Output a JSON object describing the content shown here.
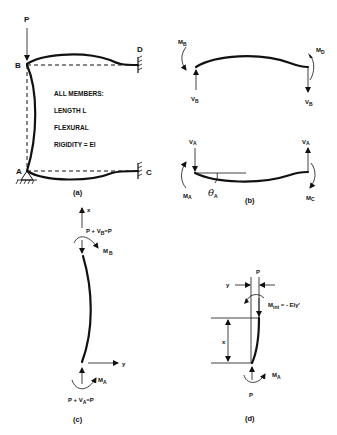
{
  "figure": {
    "panel_a": {
      "caption": "(a)",
      "load_label": "P",
      "nodes": {
        "B": "B",
        "D": "D",
        "A": "A",
        "C": "C"
      },
      "note_lines": [
        "ALL MEMBERS:",
        "LENGTH    L",
        "FLEXURAL",
        "RIGIDITY = EI"
      ]
    },
    "panel_b": {
      "caption": "(b)",
      "top_beam": {
        "moment_left": "M",
        "moment_left_sub": "B",
        "moment_right": "M",
        "moment_right_sub": "D",
        "shear_left": "V",
        "shear_left_sub": "B",
        "shear_right": "V",
        "shear_right_sub": "B"
      },
      "bottom_beam": {
        "shear_left": "V",
        "shear_left_sub": "A",
        "shear_right": "V",
        "shear_right_sub": "A",
        "moment_left": "M",
        "moment_left_sub": "A",
        "moment_right": "M",
        "moment_right_sub": "C",
        "rotation": "θ",
        "rotation_sub": "A"
      }
    },
    "panel_c": {
      "caption": "(c)",
      "axis_x": "x",
      "axis_y": "y",
      "top_force": "P + V",
      "top_force_sub": "B",
      "top_force_eq": "=P",
      "top_moment": "M",
      "top_moment_sub": "B",
      "bottom_force": "P + V",
      "bottom_force_sub": "A",
      "bottom_force_eq": "=P",
      "bottom_moment": "M",
      "bottom_moment_sub": "A"
    },
    "panel_d": {
      "caption": "(d)",
      "load_top": "P",
      "load_bottom": "P",
      "deflection": "y",
      "length": "x",
      "internal_moment": "M",
      "internal_moment_sub": "int",
      "internal_moment_eq": " = - EIy'",
      "base_moment": "M",
      "base_moment_sub": "A"
    }
  }
}
